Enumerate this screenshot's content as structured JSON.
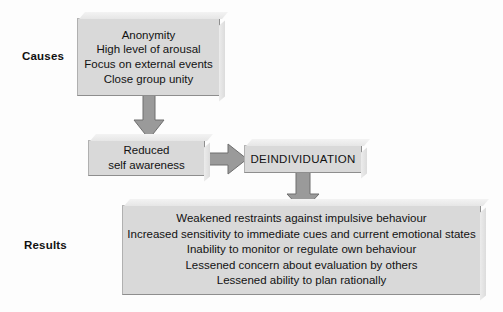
{
  "diagram": {
    "colors": {
      "box_fill": "#d9d9d9",
      "box_border": "#8e8e8e",
      "arrow_fill": "#9a9a9a",
      "arrow_border": "#6f6f6f",
      "text": "#121212",
      "background": "#fdfdfd"
    },
    "labels": {
      "causes": "Causes",
      "results": "Results"
    },
    "boxes": {
      "causes": {
        "lines": [
          "Anonymity",
          "High level of arousal",
          "Focus on external events",
          "Close group unity"
        ]
      },
      "reduced": {
        "lines": [
          "Reduced",
          "self awareness"
        ]
      },
      "deindividuation": {
        "lines": [
          "DEINDIVIDUATION"
        ]
      },
      "results": {
        "lines": [
          "Weakened restraints against impulsive behaviour",
          "Increased sensitivity to immediate cues and current emotional states",
          "Inability to monitor or regulate own behaviour",
          "Lessened concern about evaluation by others",
          "Lessened ability to plan rationally"
        ]
      }
    },
    "arrows": [
      {
        "name": "causes-to-reduced",
        "direction": "down"
      },
      {
        "name": "reduced-to-deindividuation",
        "direction": "right"
      },
      {
        "name": "deindividuation-to-results",
        "direction": "down"
      }
    ]
  }
}
